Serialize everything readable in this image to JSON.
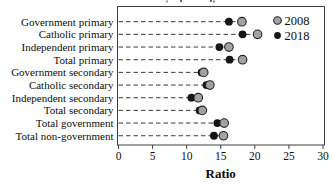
{
  "chart_data": {
    "type": "scatter",
    "variant": "horizontal-dot-plot-dumbbell",
    "title": "",
    "note": "top edge shows illegible remnant of a cropped-off title",
    "categories": [
      "Government primary",
      "Catholic primary",
      "Independent primary",
      "Total primary",
      "Government secondary",
      "Catholic secondary",
      "Independent secondary",
      "Total secondary",
      "Total government",
      "Total non-government"
    ],
    "series": [
      {
        "name": "2008",
        "color": "#a2a2a2",
        "marker": "gray-circle-dark-outline",
        "values": [
          18.1,
          20.4,
          16.2,
          18.2,
          12.5,
          13.4,
          11.7,
          12.3,
          15.5,
          15.4
        ]
      },
      {
        "name": "2018",
        "color": "#161616",
        "marker": "black-filled-circle",
        "values": [
          16.2,
          18.2,
          14.8,
          16.3,
          12.2,
          12.9,
          10.7,
          11.9,
          14.5,
          14.0
        ]
      }
    ],
    "xlabel": "Ratio",
    "xlim": [
      0,
      30
    ],
    "xticks": [
      0,
      5,
      10,
      15,
      20,
      25,
      30
    ],
    "grid": "dashed horizontal leader lines from y-axis to markers",
    "legend_position": "top-right inside plot area",
    "axis_color": "#3f3f3f",
    "leader_line_color": "#3d3d3d"
  }
}
